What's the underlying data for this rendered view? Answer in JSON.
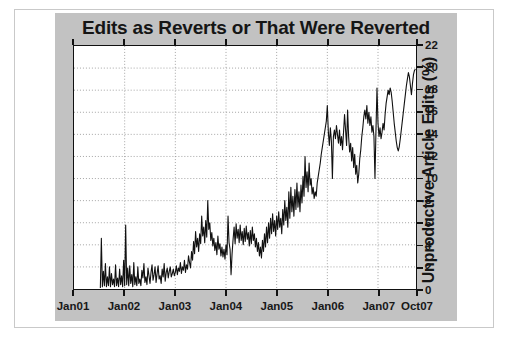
{
  "figure": {
    "title": "Edits as Reverts or That Were Reverted",
    "background_color": "#c2c2c2",
    "plot_background_color": "#ffffff",
    "line_color": "#111111",
    "frame_color": "#c9c9c9"
  },
  "chart_data": {
    "type": "line",
    "title": "Edits as Reverts or That Were Reverted",
    "xlabel": "",
    "ylabel": "Unproductive Article Edits (%)",
    "ylim": [
      0,
      22
    ],
    "xlim": [
      2001.0,
      2007.75
    ],
    "grid": true,
    "legend": null,
    "y_ticks": [
      0,
      2,
      4,
      6,
      8,
      10,
      12,
      14,
      16,
      18,
      20,
      22
    ],
    "y_tick_labels": [
      "0",
      "2",
      "4",
      "6",
      "8",
      "10",
      "12",
      "14",
      "16",
      "18",
      "20",
      "22"
    ],
    "y_axis_side": "right",
    "x_ticks": [
      2001.0,
      2002.0,
      2003.0,
      2004.0,
      2005.0,
      2006.0,
      2007.0,
      2007.75
    ],
    "x_tick_labels": [
      "Jan01",
      "Jan02",
      "Jan03",
      "Jan04",
      "Jan05",
      "Jan06",
      "Jan07",
      "Oct07"
    ],
    "series": [
      {
        "name": "Unproductive Article Edits",
        "color": "#111111",
        "x": [
          2001.52,
          2001.54,
          2001.56,
          2001.58,
          2001.6,
          2001.62,
          2001.64,
          2001.66,
          2001.68,
          2001.7,
          2001.72,
          2001.74,
          2001.76,
          2001.78,
          2001.8,
          2001.82,
          2001.84,
          2001.86,
          2001.88,
          2001.9,
          2001.92,
          2001.94,
          2001.96,
          2001.98,
          2002.0,
          2002.02,
          2002.04,
          2002.06,
          2002.08,
          2002.1,
          2002.12,
          2002.14,
          2002.16,
          2002.18,
          2002.2,
          2002.22,
          2002.24,
          2002.26,
          2002.28,
          2002.3,
          2002.32,
          2002.34,
          2002.36,
          2002.38,
          2002.4,
          2002.42,
          2002.44,
          2002.46,
          2002.48,
          2002.5,
          2002.52,
          2002.54,
          2002.56,
          2002.58,
          2002.6,
          2002.62,
          2002.64,
          2002.66,
          2002.68,
          2002.7,
          2002.72,
          2002.74,
          2002.76,
          2002.78,
          2002.8,
          2002.82,
          2002.84,
          2002.86,
          2002.88,
          2002.9,
          2002.92,
          2002.94,
          2002.96,
          2002.98,
          2003.0,
          2003.02,
          2003.04,
          2003.06,
          2003.08,
          2003.1,
          2003.12,
          2003.14,
          2003.16,
          2003.18,
          2003.2,
          2003.22,
          2003.24,
          2003.26,
          2003.28,
          2003.3,
          2003.32,
          2003.34,
          2003.36,
          2003.38,
          2003.4,
          2003.42,
          2003.44,
          2003.46,
          2003.48,
          2003.5,
          2003.52,
          2003.54,
          2003.56,
          2003.58,
          2003.6,
          2003.62,
          2003.64,
          2003.66,
          2003.68,
          2003.7,
          2003.72,
          2003.74,
          2003.76,
          2003.78,
          2003.8,
          2003.82,
          2003.84,
          2003.86,
          2003.88,
          2003.9,
          2003.92,
          2003.94,
          2003.96,
          2003.98,
          2004.0,
          2004.02,
          2004.04,
          2004.06,
          2004.08,
          2004.1,
          2004.12,
          2004.14,
          2004.16,
          2004.18,
          2004.2,
          2004.22,
          2004.24,
          2004.26,
          2004.28,
          2004.3,
          2004.32,
          2004.34,
          2004.36,
          2004.38,
          2004.4,
          2004.42,
          2004.44,
          2004.46,
          2004.48,
          2004.5,
          2004.52,
          2004.54,
          2004.56,
          2004.58,
          2004.6,
          2004.62,
          2004.64,
          2004.66,
          2004.68,
          2004.7,
          2004.72,
          2004.74,
          2004.76,
          2004.78,
          2004.8,
          2004.82,
          2004.84,
          2004.86,
          2004.88,
          2004.9,
          2004.92,
          2004.94,
          2004.96,
          2004.98,
          2005.0,
          2005.02,
          2005.04,
          2005.06,
          2005.08,
          2005.1,
          2005.12,
          2005.14,
          2005.16,
          2005.18,
          2005.2,
          2005.22,
          2005.24,
          2005.26,
          2005.28,
          2005.3,
          2005.32,
          2005.34,
          2005.36,
          2005.38,
          2005.4,
          2005.42,
          2005.44,
          2005.46,
          2005.48,
          2005.5,
          2005.52,
          2005.54,
          2005.56,
          2005.58,
          2005.6,
          2005.62,
          2005.64,
          2005.66,
          2005.68,
          2005.7,
          2005.72,
          2005.74,
          2005.76,
          2005.78,
          2005.8,
          2005.82,
          2005.84,
          2005.86,
          2005.88,
          2005.9,
          2005.92,
          2005.94,
          2005.96,
          2005.98,
          2006.0,
          2006.02,
          2006.04,
          2006.06,
          2006.08,
          2006.1,
          2006.12,
          2006.14,
          2006.16,
          2006.18,
          2006.2,
          2006.22,
          2006.24,
          2006.26,
          2006.28,
          2006.3,
          2006.32,
          2006.34,
          2006.36,
          2006.38,
          2006.4,
          2006.42,
          2006.44,
          2006.46,
          2006.48,
          2006.5,
          2006.52,
          2006.54,
          2006.56,
          2006.58,
          2006.6,
          2006.62,
          2006.64,
          2006.66,
          2006.68,
          2006.7,
          2006.72,
          2006.74,
          2006.76,
          2006.78,
          2006.8,
          2006.82,
          2006.84,
          2006.86,
          2006.88,
          2006.9,
          2006.92,
          2006.94,
          2006.96,
          2006.98,
          2007.0,
          2007.02,
          2007.04,
          2007.06,
          2007.08,
          2007.1,
          2007.12,
          2007.14,
          2007.16,
          2007.18,
          2007.2,
          2007.22,
          2007.24,
          2007.26,
          2007.28,
          2007.3,
          2007.32,
          2007.34,
          2007.36,
          2007.38,
          2007.4,
          2007.42,
          2007.44,
          2007.46,
          2007.48,
          2007.5,
          2007.52,
          2007.54,
          2007.56,
          2007.58,
          2007.6,
          2007.62,
          2007.64,
          2007.66,
          2007.68,
          2007.7,
          2007.72,
          2007.74
        ],
        "y": [
          0.1,
          4.6,
          0.2,
          1.6,
          0.3,
          2.3,
          0.2,
          1.1,
          0.3,
          2.0,
          0.2,
          1.4,
          0.4,
          0.9,
          0.2,
          2.2,
          0.3,
          1.0,
          0.2,
          1.8,
          0.4,
          1.2,
          0.2,
          2.6,
          0.3,
          5.8,
          0.4,
          1.9,
          0.3,
          2.1,
          0.5,
          1.3,
          0.2,
          2.4,
          0.4,
          1.1,
          0.3,
          2.0,
          0.5,
          0.9,
          0.3,
          1.7,
          1.0,
          2.3,
          0.6,
          1.1,
          0.4,
          1.9,
          1.2,
          0.5,
          1.5,
          2.2,
          0.8,
          1.3,
          2.0,
          0.6,
          1.4,
          2.1,
          0.9,
          1.2,
          0.5,
          1.8,
          1.1,
          2.3,
          0.7,
          1.5,
          1.9,
          1.0,
          1.6,
          2.0,
          1.1,
          1.4,
          1.8,
          1.2,
          1.5,
          2.1,
          1.3,
          1.9,
          1.6,
          2.4,
          1.4,
          2.0,
          1.7,
          2.6,
          1.5,
          2.2,
          1.8,
          3.0,
          2.4,
          1.9,
          3.4,
          2.6,
          4.3,
          3.2,
          5.2,
          3.8,
          4.6,
          3.4,
          5.0,
          4.1,
          6.6,
          4.8,
          5.6,
          4.2,
          6.2,
          4.7,
          8.0,
          5.4,
          6.0,
          4.4,
          5.1,
          3.9,
          4.6,
          3.5,
          4.2,
          3.1,
          4.8,
          3.6,
          4.1,
          3.0,
          3.8,
          2.9,
          3.6,
          2.7,
          4.0,
          3.1,
          6.6,
          4.2,
          3.6,
          1.3,
          3.2,
          4.5,
          5.6,
          4.1,
          5.9,
          4.6,
          5.4,
          4.2,
          5.8,
          4.4,
          5.2,
          4.0,
          5.5,
          4.3,
          5.7,
          4.5,
          5.1,
          3.9,
          5.3,
          4.1,
          5.6,
          4.4,
          5.0,
          3.8,
          4.6,
          3.4,
          4.2,
          3.0,
          3.8,
          2.8,
          4.4,
          3.4,
          5.0,
          3.8,
          5.6,
          4.2,
          6.0,
          4.6,
          6.4,
          5.0,
          6.8,
          5.2,
          6.2,
          4.8,
          6.6,
          5.4,
          7.0,
          5.6,
          6.4,
          5.0,
          7.2,
          5.8,
          8.0,
          6.2,
          7.4,
          5.6,
          8.8,
          6.4,
          9.2,
          7.0,
          8.4,
          6.6,
          9.0,
          7.2,
          9.6,
          7.4,
          8.8,
          7.0,
          9.4,
          7.8,
          10.2,
          8.4,
          12.0,
          9.2,
          10.6,
          8.8,
          11.4,
          9.4,
          10.0,
          8.6,
          9.2,
          8.2,
          8.8,
          8.4,
          9.6,
          10.2,
          10.8,
          11.4,
          12.2,
          12.8,
          13.4,
          14.0,
          14.6,
          15.2,
          16.6,
          14.2,
          13.0,
          14.6,
          13.4,
          10.0,
          13.8,
          14.4,
          13.6,
          14.8,
          14.0,
          13.2,
          14.4,
          13.0,
          13.8,
          12.6,
          14.2,
          15.8,
          14.4,
          13.0,
          16.2,
          13.8,
          12.4,
          13.2,
          11.6,
          12.8,
          11.0,
          12.2,
          10.4,
          11.2,
          9.6,
          10.4,
          11.8,
          12.6,
          13.8,
          14.6,
          15.6,
          16.2,
          15.4,
          16.6,
          15.0,
          16.0,
          14.8,
          15.6,
          14.2,
          14.8,
          13.8,
          10.0,
          14.4,
          18.2,
          15.0,
          13.8,
          14.6,
          13.6,
          14.2,
          15.0,
          14.4,
          15.8,
          16.8,
          17.4,
          18.0,
          17.6,
          18.2,
          17.8,
          17.0,
          16.0,
          15.0,
          14.2,
          13.4,
          12.8,
          12.5,
          12.9,
          13.6,
          14.4,
          15.2,
          16.0,
          16.8,
          17.6,
          18.4,
          19.0,
          19.6,
          19.2,
          18.4,
          17.6,
          18.6,
          19.4,
          19.8,
          19.9
        ]
      }
    ]
  },
  "axes": {
    "y_title": "Unproductive Article Edits (%)",
    "y_labels": [
      "22",
      "20",
      "18",
      "16",
      "14",
      "12",
      "10",
      "8",
      "6",
      "4",
      "2",
      "0"
    ],
    "x_labels": [
      "Jan01",
      "Jan02",
      "Jan03",
      "Jan04",
      "Jan05",
      "Jan06",
      "Jan07",
      "Oct07"
    ]
  }
}
